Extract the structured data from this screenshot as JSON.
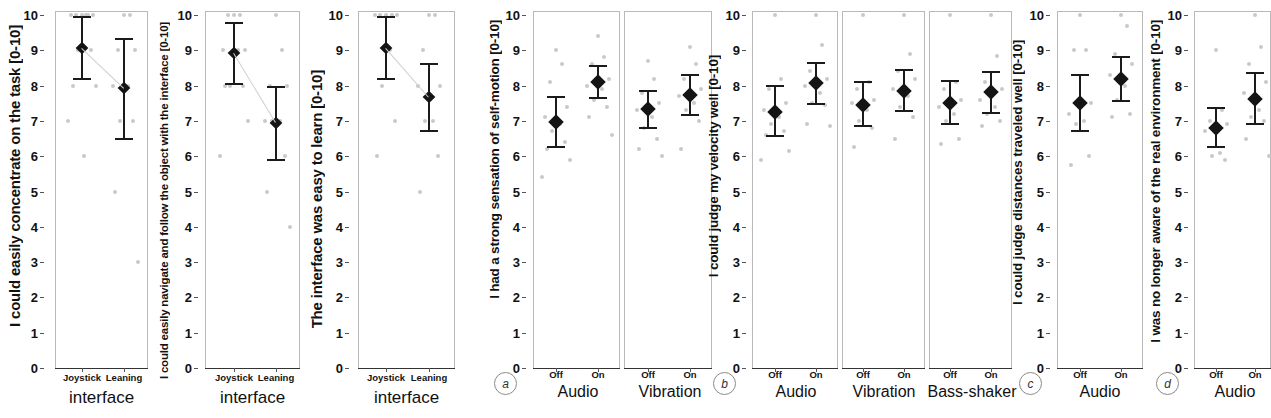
{
  "figure": {
    "caption_letters": [
      "a",
      "b",
      "c",
      "d"
    ],
    "y_axis_ticks": [
      "0",
      "1",
      "2",
      "3",
      "4",
      "5",
      "6",
      "7",
      "8",
      "9",
      "10"
    ],
    "y_range": [
      0,
      10
    ],
    "marker_color": "#141414",
    "raw_point_color": "#c9c9c9",
    "panel_border_color": "#b9b9b9"
  },
  "chart_data": [
    {
      "id": "p1",
      "type": "scatter",
      "title": "",
      "ylabel": "I could easily concentrate on the task [0-10]",
      "xlabel": "interface",
      "ylim": [
        0,
        10
      ],
      "yticks": [
        0,
        1,
        2,
        3,
        4,
        5,
        6,
        7,
        8,
        9,
        10
      ],
      "grid": false,
      "legend": "none",
      "groups": [
        {
          "group_label": "interface",
          "categories": [
            "Joystick",
            "Leaning"
          ],
          "means": [
            9.07,
            7.94
          ],
          "ci_low": [
            8.2,
            6.5
          ],
          "ci_high": [
            9.95,
            9.32
          ],
          "raw_points": [
            [
              10,
              10,
              10,
              10,
              10,
              10,
              9,
              9,
              8,
              8,
              7,
              6
            ],
            [
              10,
              10,
              9,
              9,
              8,
              8,
              7,
              7,
              5,
              3
            ]
          ],
          "connected": true
        }
      ]
    },
    {
      "id": "p2",
      "type": "scatter",
      "ylabel": "I could easily navigate and follow the object with the interface [0-10]",
      "xlabel": "interface",
      "ylim": [
        0,
        10
      ],
      "yticks": [
        0,
        1,
        2,
        3,
        4,
        5,
        6,
        7,
        8,
        9,
        10
      ],
      "grid": false,
      "legend": "none",
      "groups": [
        {
          "group_label": "interface",
          "categories": [
            "Joystick",
            "Leaning"
          ],
          "means": [
            8.92,
            6.95
          ],
          "ci_low": [
            8.05,
            5.89
          ],
          "ci_high": [
            9.78,
            7.96
          ],
          "raw_points": [
            [
              10,
              10,
              10,
              9,
              9,
              9,
              8,
              8,
              8,
              7,
              6
            ],
            [
              10,
              9,
              8,
              8,
              7,
              7,
              7,
              6,
              5,
              4
            ]
          ],
          "connected": true
        }
      ]
    },
    {
      "id": "p3",
      "type": "scatter",
      "ylabel": "The interface was easy to learn [0-10]",
      "xlabel": "interface",
      "ylim": [
        0,
        10
      ],
      "yticks": [
        0,
        1,
        2,
        3,
        4,
        5,
        6,
        7,
        8,
        9,
        10
      ],
      "grid": false,
      "legend": "none",
      "groups": [
        {
          "group_label": "interface",
          "categories": [
            "Joystick",
            "Leaning"
          ],
          "means": [
            9.06,
            7.67
          ],
          "ci_low": [
            8.2,
            6.72
          ],
          "ci_high": [
            9.93,
            8.6
          ],
          "raw_points": [
            [
              10,
              10,
              10,
              10,
              10,
              9,
              8,
              7,
              6
            ],
            [
              10,
              10,
              9,
              8,
              8,
              7,
              7,
              6,
              5
            ]
          ],
          "connected": true
        }
      ]
    },
    {
      "id": "pa",
      "letter": "a",
      "type": "scatter",
      "ylabel": "I had a strong sensation of self-motion [0-10]",
      "ylim": [
        0,
        10
      ],
      "yticks": [
        0,
        1,
        2,
        3,
        4,
        5,
        6,
        7,
        8,
        9,
        10
      ],
      "grid": false,
      "legend": "none",
      "groups": [
        {
          "group_label": "Audio",
          "categories": [
            "Off",
            "On"
          ],
          "means": [
            6.97,
            8.1
          ],
          "ci_low": [
            6.27,
            7.65
          ],
          "ci_high": [
            7.67,
            8.56
          ],
          "raw_points": [
            [
              9.0,
              8.6,
              8.1,
              7.4,
              7.1,
              6.9,
              6.7,
              6.4,
              6.2,
              5.9,
              5.4
            ],
            [
              9.4,
              8.8,
              8.6,
              8.2,
              8.0,
              7.9,
              7.6,
              7.4,
              7.1,
              6.6
            ]
          ]
        },
        {
          "group_label": "Vibration",
          "categories": [
            "Off",
            "On"
          ],
          "means": [
            7.33,
            7.74
          ],
          "ci_low": [
            6.8,
            7.18
          ],
          "ci_high": [
            7.86,
            8.3
          ],
          "raw_points": [
            [
              8.7,
              8.2,
              7.8,
              7.5,
              7.3,
              7.1,
              6.8,
              6.5,
              6.2,
              6.0
            ],
            [
              9.1,
              8.6,
              8.2,
              7.9,
              7.7,
              7.5,
              7.3,
              7.0,
              6.2
            ]
          ]
        }
      ]
    },
    {
      "id": "pb",
      "letter": "b",
      "type": "scatter",
      "ylabel": "I could judge my velocity well [0-10]",
      "ylim": [
        0,
        10
      ],
      "yticks": [
        0,
        1,
        2,
        3,
        4,
        5,
        6,
        7,
        8,
        9,
        10
      ],
      "grid": false,
      "legend": "none",
      "groups": [
        {
          "group_label": "Audio",
          "categories": [
            "Off",
            "On"
          ],
          "means": [
            7.26,
            8.06
          ],
          "ci_low": [
            6.58,
            7.48
          ],
          "ci_high": [
            7.99,
            8.65
          ],
          "raw_points": [
            [
              10.0,
              8.2,
              7.9,
              7.5,
              7.3,
              7.1,
              6.9,
              6.7,
              6.6,
              6.15,
              5.9
            ],
            [
              10.0,
              9.15,
              8.4,
              8.2,
              8.0,
              7.8,
              7.5,
              7.45,
              6.9,
              6.85
            ]
          ]
        },
        {
          "group_label": "Vibration",
          "categories": [
            "Off",
            "On"
          ],
          "means": [
            7.45,
            7.86
          ],
          "ci_low": [
            6.85,
            7.28
          ],
          "ci_high": [
            8.1,
            8.45
          ],
          "raw_points": [
            [
              10.0,
              8.1,
              7.9,
              7.6,
              7.5,
              7.3,
              7.0,
              6.8,
              6.25
            ],
            [
              10.0,
              8.9,
              8.4,
              8.2,
              7.9,
              7.7,
              7.4,
              7.1,
              6.5
            ]
          ]
        },
        {
          "group_label": "Bass-shaker",
          "categories": [
            "Off",
            "On"
          ],
          "means": [
            7.52,
            7.81
          ],
          "ci_low": [
            6.92,
            7.22
          ],
          "ci_high": [
            8.12,
            8.38
          ],
          "raw_points": [
            [
              10.0,
              8.1,
              7.9,
              7.6,
              7.4,
              7.2,
              7.0,
              6.5,
              6.35
            ],
            [
              10.0,
              8.85,
              8.1,
              7.9,
              7.6,
              7.4,
              7.2,
              7.0,
              6.85
            ]
          ]
        }
      ]
    },
    {
      "id": "pc",
      "letter": "c",
      "type": "scatter",
      "ylabel": "I could judge distances traveled well [0-10]",
      "ylim": [
        0,
        10
      ],
      "yticks": [
        0,
        1,
        2,
        3,
        4,
        5,
        6,
        7,
        8,
        9,
        10
      ],
      "grid": false,
      "legend": "none",
      "groups": [
        {
          "group_label": "Audio",
          "categories": [
            "Off",
            "On"
          ],
          "means": [
            7.51,
            8.18
          ],
          "ci_low": [
            6.72,
            7.55
          ],
          "ci_high": [
            8.3,
            8.82
          ],
          "raw_points": [
            [
              10.0,
              9.0,
              9.0,
              7.5,
              7.2,
              7.0,
              6.9,
              6.0,
              5.75
            ],
            [
              10.0,
              9.7,
              8.9,
              8.6,
              8.3,
              8.0,
              7.6,
              7.2,
              7.1
            ]
          ]
        }
      ]
    },
    {
      "id": "pd",
      "letter": "d",
      "type": "scatter",
      "ylabel": "I was no longer aware of the real environment [0-10]",
      "ylim": [
        0,
        10
      ],
      "yticks": [
        0,
        1,
        2,
        3,
        4,
        5,
        6,
        7,
        8,
        9,
        10
      ],
      "grid": false,
      "legend": "none",
      "groups": [
        {
          "group_label": "Audio",
          "categories": [
            "Off",
            "On"
          ],
          "means": [
            6.81,
            7.63
          ],
          "ci_low": [
            6.27,
            6.92
          ],
          "ci_high": [
            7.36,
            8.36
          ],
          "raw_points": [
            [
              9.0,
              7.3,
              7.0,
              6.9,
              6.7,
              6.1,
              6.0,
              5.9
            ],
            [
              10.0,
              9.1,
              8.6,
              8.1,
              7.8,
              7.3,
              7.1,
              7.0,
              6.5,
              6.0
            ]
          ]
        }
      ]
    }
  ]
}
